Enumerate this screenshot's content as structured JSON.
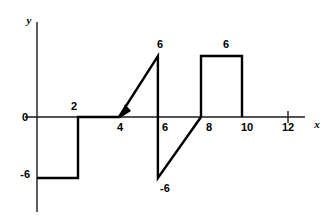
{
  "chart_data": {
    "type": "line",
    "title": "",
    "subtitle": "",
    "xlabel": "x",
    "ylabel": "y",
    "xlim": [
      -0.8,
      13.6
    ],
    "ylim": [
      -9.0,
      8.5
    ],
    "grid": false,
    "legend": null,
    "x_ticks": [
      2,
      4,
      6,
      8,
      10,
      12
    ],
    "x_tick_labels": [
      "2",
      "4",
      "6",
      "8",
      "10",
      "12"
    ],
    "y_ticks": [
      -6,
      0
    ],
    "y_tick_labels": [
      "-6",
      "0"
    ],
    "annotations": [
      {
        "text": "6",
        "x": 5.9,
        "y": 6,
        "position": "above"
      },
      {
        "text": "6",
        "x": 9.0,
        "y": 6,
        "position": "above"
      },
      {
        "text": "-6",
        "x": 6.0,
        "y": -6,
        "position": "below"
      }
    ],
    "series": [
      {
        "name": "piecewise-waveform",
        "color": "#000000",
        "points": [
          {
            "x": 0,
            "y": -6
          },
          {
            "x": 2,
            "y": -6
          },
          {
            "x": 2,
            "y": 0
          },
          {
            "x": 4,
            "y": 0
          },
          {
            "x": 5.9,
            "y": 6
          },
          {
            "x": 5.9,
            "y": -6
          },
          {
            "x": 8,
            "y": 0
          },
          {
            "x": 8,
            "y": 6
          },
          {
            "x": 10,
            "y": 6
          },
          {
            "x": 10,
            "y": 0
          }
        ]
      }
    ],
    "markers": [
      {
        "type": "arrowhead",
        "x": 4,
        "y": 0,
        "direction": "down-left"
      }
    ]
  },
  "labels": {
    "y_axis_name": "y",
    "x_axis_name": "x",
    "zero": "0",
    "neg_six_left": "-6",
    "tick_2": "2",
    "tick_4": "4",
    "tick_6": "6",
    "tick_8": "8",
    "tick_10": "10",
    "tick_12": "12",
    "peak_left": "6",
    "peak_right": "6",
    "trough": "-6"
  },
  "colors": {
    "background": "#ffffff",
    "axis": "#1a1a1a",
    "curve": "#000000",
    "text": "#000000"
  }
}
